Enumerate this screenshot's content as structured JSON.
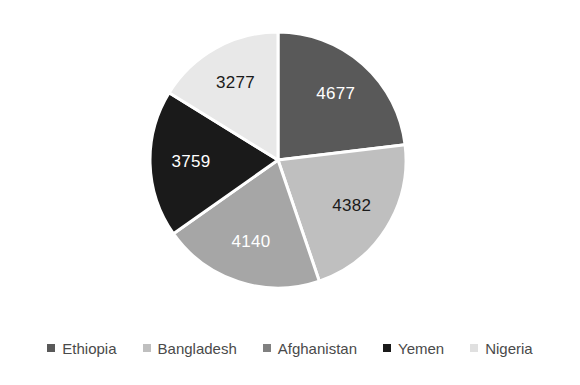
{
  "chart_data": {
    "type": "pie",
    "title": "",
    "subtitle": "",
    "xlabel": "",
    "ylabel": "",
    "grid": false,
    "legend_position": "bottom",
    "start_angle_deg": 0,
    "direction": "clockwise",
    "total": 20235,
    "categories": [
      "Ethiopia",
      "Bangladesh",
      "Afghanistan",
      "Yemen",
      "Nigeria"
    ],
    "values": [
      4677,
      4382,
      4140,
      3759,
      3277
    ],
    "data_labels": [
      "4677",
      "4382",
      "4140",
      "3759",
      "3277"
    ],
    "slices": [
      {
        "name": "Ethiopia",
        "value": 4677,
        "label": "4677",
        "color": "#595959",
        "label_color": "#ffffff",
        "start_deg": 0,
        "end_deg": 83.2,
        "percent": "23.1%"
      },
      {
        "name": "Bangladesh",
        "value": 4382,
        "label": "4382",
        "color": "#bfbfbf",
        "label_color": "#1a1a1a",
        "start_deg": 83.2,
        "end_deg": 161.17,
        "percent": "21.7%"
      },
      {
        "name": "Afghanistan",
        "value": 4140,
        "label": "4140",
        "color": "#a6a6a6",
        "label_color": "#ffffff",
        "start_deg": 161.17,
        "end_deg": 234.83,
        "percent": "20.5%"
      },
      {
        "name": "Yemen",
        "value": 3759,
        "label": "3759",
        "color": "#1a1a1a",
        "label_color": "#ffffff",
        "start_deg": 234.83,
        "end_deg": 301.72,
        "percent": "18.6%"
      },
      {
        "name": "Nigeria",
        "value": 3277,
        "label": "3277",
        "color": "#e8e8e8",
        "label_color": "#1a1a1a",
        "start_deg": 301.72,
        "end_deg": 360,
        "percent": "16.2%"
      }
    ]
  },
  "legend": {
    "items": [
      {
        "label": "Ethiopia",
        "color": "#595959"
      },
      {
        "label": "Bangladesh",
        "color": "#bfbfbf"
      },
      {
        "label": "Afghanistan",
        "color": "#808080"
      },
      {
        "label": "Yemen",
        "color": "#1a1a1a"
      },
      {
        "label": "Nigeria",
        "color": "#e0e0e0"
      }
    ]
  },
  "colors": {
    "background": "#ffffff",
    "slice_border": "#ffffff",
    "legend_text": "#4a4a4a"
  }
}
